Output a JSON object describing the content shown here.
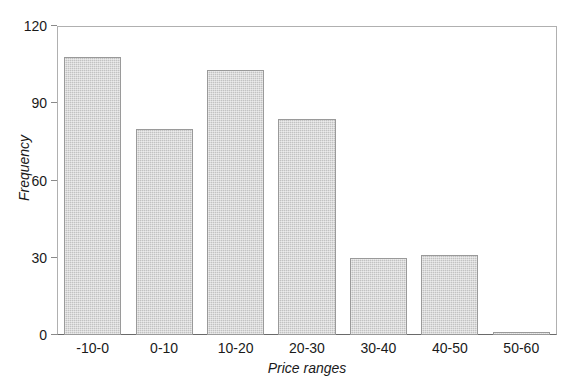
{
  "chart_data": {
    "type": "bar",
    "title": "",
    "subtitle": "",
    "xlabel": "Price ranges",
    "ylabel": "Frequency",
    "categories": [
      "-10-0",
      "0-10",
      "10-20",
      "20-30",
      "30-40",
      "40-50",
      "50-60"
    ],
    "values": [
      108,
      80,
      103,
      84,
      30,
      31,
      1
    ],
    "ylim": [
      0,
      120
    ],
    "yticks": [
      0,
      30,
      60,
      90,
      120
    ],
    "ytick_labels": [
      "0",
      "30",
      "60",
      "90",
      "120"
    ],
    "grid": false,
    "legend": null,
    "bar_color": "#c2c2c2",
    "bar_edge_color": "#9a9a9a",
    "axis_color": "#8a8a8a",
    "text_color": "#1a1a1a"
  }
}
